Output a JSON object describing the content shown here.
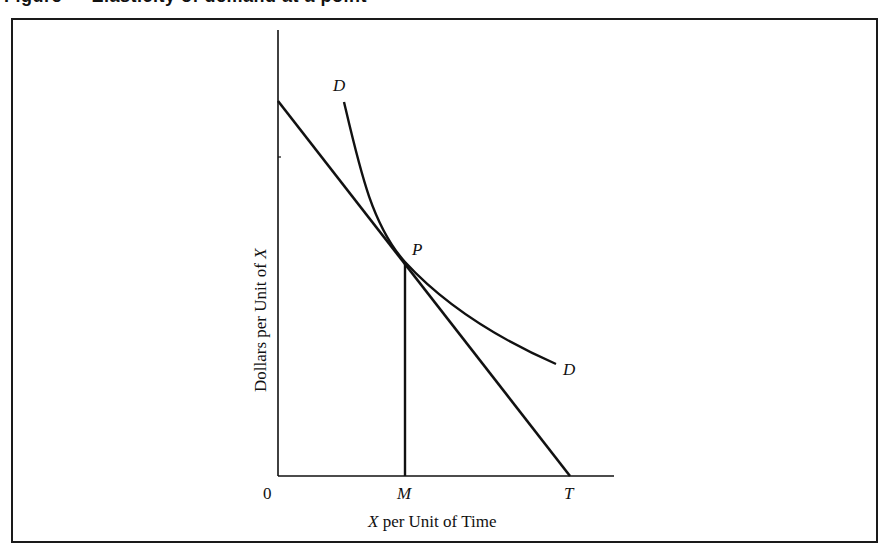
{
  "caption": {
    "text": "Figure  —  Elasticity of demand at a point"
  },
  "axes": {
    "y_label_prefix": "Dollars per Unit of ",
    "y_label_var": "X",
    "x_label_var": "X",
    "x_label_suffix": " per Unit of Time",
    "origin_label": "0"
  },
  "points": {
    "P": "P",
    "M": "M",
    "T": "T"
  },
  "curves": {
    "demand_label_top": "D",
    "demand_label_bottom": "D"
  },
  "colors": {
    "ink": "#111111",
    "frame": "#1a1a1a",
    "background": "#ffffff"
  }
}
